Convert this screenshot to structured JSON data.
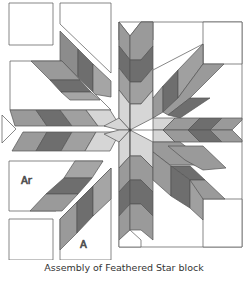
{
  "title": "Assembly of Feathered Star block",
  "labels": {
    "ar": "Ar",
    "a": "A"
  },
  "colors": {
    "outline": "#555555",
    "white": "#ffffff",
    "light": "#d6d6d6",
    "mid": "#9a9a9a",
    "dark": "#6e6e6e",
    "medium": "#888888"
  },
  "pieces": [
    "corner-square-top-left",
    "top-left-trapezoid",
    "top-left-feather-unit",
    "left-upper-feather-unit",
    "left-triangle",
    "left-lower-strip",
    "ar-feather-unit",
    "corner-square-bottom-left",
    "a-feather-unit",
    "assembled-right-half"
  ]
}
